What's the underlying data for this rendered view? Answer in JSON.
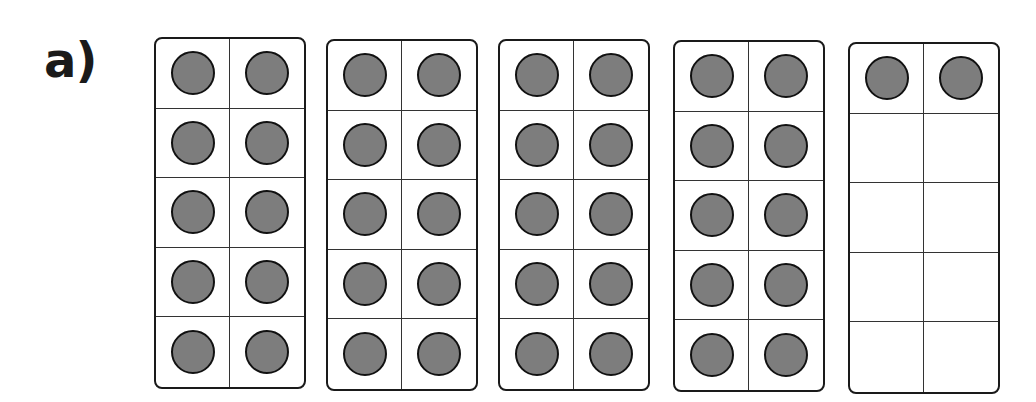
{
  "question_label": "a)",
  "counter_color": "#7d7d7d",
  "frames": [
    {
      "filled": 10,
      "left": 154,
      "top": 37,
      "width": 152,
      "height": 352
    },
    {
      "filled": 10,
      "left": 326,
      "top": 39,
      "width": 152,
      "height": 352
    },
    {
      "filled": 10,
      "left": 498,
      "top": 39,
      "width": 152,
      "height": 352
    },
    {
      "filled": 10,
      "left": 673,
      "top": 40,
      "width": 152,
      "height": 352
    },
    {
      "filled": 2,
      "left": 848,
      "top": 42,
      "width": 152,
      "height": 352
    }
  ],
  "total": 42
}
